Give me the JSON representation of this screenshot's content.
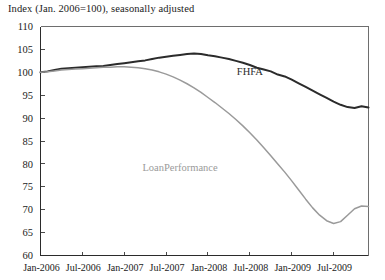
{
  "chart_data": {
    "type": "line",
    "title": "Index (Jan. 2006=100), seasonally adjusted",
    "xlabel": "",
    "ylabel": "",
    "ylim": [
      60,
      110
    ],
    "ytick_labels": [
      "110",
      "105",
      "100",
      "95",
      "90",
      "85",
      "80",
      "75",
      "70",
      "65",
      "60"
    ],
    "ytick_values": [
      110,
      105,
      100,
      95,
      90,
      85,
      80,
      75,
      70,
      65,
      60
    ],
    "xtick_labels": [
      "Jan-2006",
      "Jul-2006",
      "Jan-2007",
      "Jul-2007",
      "Jan-2008",
      "Jul-2008",
      "Jan-2009",
      "Jul-2009"
    ],
    "grid": false,
    "legend_position": "inline-annotations",
    "x_unit": "months since Jan-2006",
    "x_range_months": [
      0,
      47
    ],
    "series": [
      {
        "name": "FHFA",
        "color": "#2b2b2b",
        "label_x_month": 30,
        "label_y_value": 99.5,
        "x": [
          0,
          1,
          2,
          3,
          4,
          5,
          6,
          7,
          8,
          9,
          10,
          11,
          12,
          13,
          14,
          15,
          16,
          17,
          18,
          19,
          20,
          21,
          22,
          23,
          24,
          25,
          26,
          27,
          28,
          29,
          30,
          31,
          32,
          33,
          34,
          35,
          36,
          37,
          38,
          39,
          40,
          41,
          42,
          43,
          44,
          45,
          46,
          47
        ],
        "values": [
          100.0,
          100.2,
          100.5,
          100.8,
          100.9,
          101.0,
          101.1,
          101.2,
          101.3,
          101.4,
          101.6,
          101.8,
          102.0,
          102.2,
          102.4,
          102.6,
          102.9,
          103.2,
          103.4,
          103.6,
          103.8,
          104.0,
          104.1,
          104.0,
          103.7,
          103.5,
          103.2,
          102.9,
          102.5,
          102.1,
          101.6,
          101.0,
          100.6,
          100.2,
          99.5,
          99.1,
          98.4,
          97.6,
          96.8,
          96.0,
          95.2,
          94.4,
          93.6,
          92.9,
          92.4,
          92.2,
          92.6,
          92.3
        ]
      },
      {
        "name": "LoanPerformance",
        "color": "#9a9a9a",
        "label_x_month": 20,
        "label_y_value": 78.5,
        "x": [
          0,
          1,
          2,
          3,
          4,
          5,
          6,
          7,
          8,
          9,
          10,
          11,
          12,
          13,
          14,
          15,
          16,
          17,
          18,
          19,
          20,
          21,
          22,
          23,
          24,
          25,
          26,
          27,
          28,
          29,
          30,
          31,
          32,
          33,
          34,
          35,
          36,
          37,
          38,
          39,
          40,
          41,
          42,
          43,
          44,
          45,
          46,
          47
        ],
        "values": [
          100.0,
          100.1,
          100.3,
          100.5,
          100.6,
          100.7,
          100.8,
          100.9,
          101.0,
          101.1,
          101.1,
          101.2,
          101.2,
          101.1,
          101.0,
          100.8,
          100.5,
          100.1,
          99.6,
          99.0,
          98.3,
          97.5,
          96.6,
          95.6,
          94.5,
          93.4,
          92.2,
          91.0,
          89.7,
          88.3,
          86.8,
          85.2,
          83.5,
          81.8,
          80.0,
          78.2,
          76.3,
          74.3,
          72.3,
          70.4,
          68.8,
          67.6,
          67.0,
          67.4,
          68.8,
          70.2,
          70.8,
          70.7
        ]
      }
    ]
  },
  "series_labels": {
    "fhfa": "FHFA",
    "loan_performance": "LoanPerformance"
  }
}
